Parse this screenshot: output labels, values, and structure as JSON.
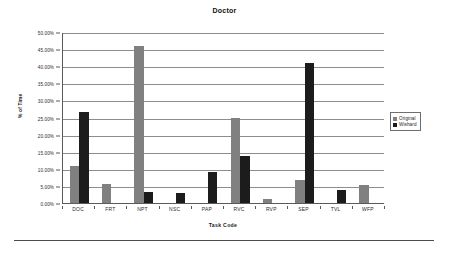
{
  "chart_data": {
    "type": "bar",
    "title": "Doctor",
    "xlabel": "Task Code",
    "ylabel": "% of Time",
    "categories": [
      "DOC",
      "FRT",
      "NPT",
      "NSC",
      "PAP",
      "RVC",
      "RVP",
      "SEP",
      "TVL",
      "WFP"
    ],
    "series": [
      {
        "name": "Original",
        "color": "#808080",
        "values": [
          10.8,
          5.5,
          45.8,
          0.0,
          0.0,
          24.8,
          1.3,
          6.7,
          0.0,
          5.2
        ]
      },
      {
        "name": "Wishard",
        "color": "#1c1c1c",
        "values": [
          26.5,
          0.0,
          3.1,
          2.8,
          9.2,
          13.8,
          0.0,
          40.8,
          3.9,
          0.0
        ]
      }
    ],
    "ylim": [
      0,
      50
    ],
    "ytick_values": [
      0,
      5,
      10,
      15,
      20,
      25,
      30,
      35,
      40,
      45,
      50
    ],
    "ytick_labels": [
      "0.00%",
      "5.00%",
      "10.00%",
      "15.00%",
      "20.00%",
      "25.00%",
      "30.00%",
      "35.00%",
      "40.00%",
      "45.00%",
      "50.00%"
    ],
    "grid": true,
    "legend_position": "right",
    "legend_entries": [
      "Original",
      "Wishard"
    ]
  }
}
